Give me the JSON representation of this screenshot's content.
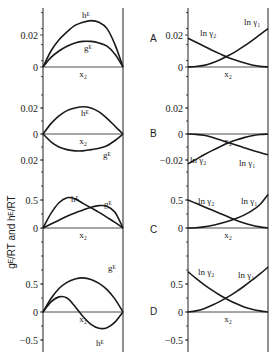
{
  "figure": {
    "ylabel": "gᴱ/RT  and  hᴱ/RT",
    "x_axis_label": "x₂",
    "panel_labels": [
      "A",
      "B",
      "C",
      "D"
    ]
  },
  "chart_data": [
    {
      "panel": "A",
      "side": "left",
      "type": "line",
      "xlabel": "x₂",
      "ylim": [
        -0.006,
        0.04
      ],
      "yticks": [
        {
          "value": 0,
          "label": "0"
        },
        {
          "value": 0.02,
          "label": "0.02"
        }
      ],
      "x": [
        0,
        0.1,
        0.2,
        0.3,
        0.4,
        0.5,
        0.6,
        0.7,
        0.8,
        0.9,
        1.0
      ],
      "series": [
        {
          "name": "hᴱ",
          "values": [
            0,
            0.01,
            0.017,
            0.022,
            0.026,
            0.028,
            0.029,
            0.028,
            0.024,
            0.014,
            0
          ]
        },
        {
          "name": "gᴱ",
          "values": [
            0,
            0.006,
            0.01,
            0.013,
            0.015,
            0.016,
            0.016,
            0.015,
            0.013,
            0.008,
            0
          ]
        }
      ]
    },
    {
      "panel": "A",
      "side": "right",
      "type": "line",
      "xlabel": "x₂",
      "ylim": [
        -0.006,
        0.04
      ],
      "yticks": [
        {
          "value": 0,
          "label": "0"
        },
        {
          "value": 0.02,
          "label": "0.02"
        }
      ],
      "x": [
        0,
        0.1,
        0.2,
        0.3,
        0.4,
        0.5,
        0.6,
        0.7,
        0.8,
        0.9,
        1.0
      ],
      "series": [
        {
          "name": "ln γ₂",
          "values": [
            0.018,
            0.0155,
            0.013,
            0.0105,
            0.0082,
            0.006,
            0.0042,
            0.0026,
            0.0013,
            0.0004,
            0
          ]
        },
        {
          "name": "ln γ₁",
          "values": [
            0,
            0.0003,
            0.001,
            0.0025,
            0.0045,
            0.007,
            0.0098,
            0.013,
            0.0165,
            0.0203,
            0.024
          ]
        }
      ]
    },
    {
      "panel": "B",
      "side": "left",
      "type": "line",
      "xlabel": "x₂",
      "ylim": [
        -0.03,
        0.04
      ],
      "yticks": [
        {
          "value": 0.02,
          "label": "0.02"
        },
        {
          "value": 0,
          "label": "0"
        },
        {
          "value": -0.02,
          "label": "0.02"
        }
      ],
      "x": [
        0,
        0.1,
        0.2,
        0.3,
        0.4,
        0.5,
        0.6,
        0.7,
        0.8,
        0.9,
        1.0
      ],
      "series": [
        {
          "name": "hᴱ",
          "values": [
            0,
            0.008,
            0.014,
            0.018,
            0.02,
            0.021,
            0.02,
            0.017,
            0.012,
            0.006,
            0
          ]
        },
        {
          "name": "gᴱ",
          "values": [
            0,
            -0.006,
            -0.01,
            -0.012,
            -0.013,
            -0.013,
            -0.012,
            -0.011,
            -0.009,
            -0.005,
            0
          ]
        }
      ]
    },
    {
      "panel": "B",
      "side": "right",
      "type": "line",
      "xlabel": "x₂",
      "ylim": [
        -0.03,
        0.04
      ],
      "yticks": [
        {
          "value": 0.02,
          "label": "0.02"
        },
        {
          "value": 0,
          "label": "0"
        },
        {
          "value": -0.02,
          "label": "−0.02"
        }
      ],
      "x": [
        0,
        0.1,
        0.2,
        0.3,
        0.4,
        0.5,
        0.6,
        0.7,
        0.8,
        0.9,
        1.0
      ],
      "series": [
        {
          "name": "ln γ₁",
          "values": [
            0,
            -0.0003,
            -0.001,
            -0.0025,
            -0.0045,
            -0.0065,
            -0.0085,
            -0.0105,
            -0.0125,
            -0.0143,
            -0.016
          ]
        },
        {
          "name": "ln γ₂",
          "values": [
            -0.023,
            -0.0195,
            -0.016,
            -0.0128,
            -0.0098,
            -0.007,
            -0.0047,
            -0.0028,
            -0.0013,
            -0.0004,
            0
          ]
        }
      ]
    },
    {
      "panel": "C",
      "side": "left",
      "type": "line",
      "xlabel": "x₂",
      "ylim": [
        -0.5,
        1.0
      ],
      "yticks": [
        {
          "value": 0,
          "label": "0"
        },
        {
          "value": 0.5,
          "label": "0.5"
        }
      ],
      "x": [
        0,
        0.1,
        0.2,
        0.3,
        0.4,
        0.5,
        0.6,
        0.7,
        0.8,
        0.9,
        1.0
      ],
      "series": [
        {
          "name": "hᴱ",
          "values": [
            0,
            0.26,
            0.45,
            0.54,
            0.52,
            0.44,
            0.36,
            0.28,
            0.19,
            0.1,
            0
          ]
        },
        {
          "name": "gᴱ",
          "values": [
            0,
            0.07,
            0.14,
            0.21,
            0.27,
            0.32,
            0.37,
            0.4,
            0.39,
            0.28,
            0
          ]
        }
      ]
    },
    {
      "panel": "C",
      "side": "right",
      "type": "line",
      "xlabel": "x₂",
      "ylim": [
        -0.5,
        1.0
      ],
      "yticks": [
        {
          "value": 0,
          "label": "0"
        },
        {
          "value": 0.5,
          "label": "0.5"
        }
      ],
      "x": [
        0,
        0.1,
        0.2,
        0.3,
        0.4,
        0.5,
        0.6,
        0.7,
        0.8,
        0.9,
        1.0
      ],
      "series": [
        {
          "name": "ln γ₂",
          "values": [
            0.5,
            0.44,
            0.38,
            0.32,
            0.26,
            0.2,
            0.14,
            0.09,
            0.05,
            0.02,
            0
          ]
        },
        {
          "name": "ln γ₁",
          "values": [
            0,
            0.005,
            0.02,
            0.045,
            0.08,
            0.12,
            0.17,
            0.23,
            0.31,
            0.42,
            0.6
          ]
        }
      ]
    },
    {
      "panel": "D",
      "side": "left",
      "type": "line",
      "xlabel": "x₂",
      "ylim": [
        -0.75,
        1.0
      ],
      "yticks": [
        {
          "value": 0.5,
          "label": "0.5"
        },
        {
          "value": 0,
          "label": "0"
        },
        {
          "value": -0.5,
          "label": "−0.5"
        }
      ],
      "x": [
        0,
        0.1,
        0.2,
        0.3,
        0.4,
        0.5,
        0.6,
        0.7,
        0.8,
        0.9,
        1.0
      ],
      "series": [
        {
          "name": "gᴱ",
          "values": [
            0,
            0.24,
            0.42,
            0.53,
            0.59,
            0.61,
            0.58,
            0.51,
            0.4,
            0.23,
            0
          ]
        },
        {
          "name": "hᴱ",
          "values": [
            0,
            0.18,
            0.27,
            0.25,
            0.1,
            -0.08,
            -0.22,
            -0.29,
            -0.28,
            -0.18,
            0
          ]
        }
      ]
    },
    {
      "panel": "D",
      "side": "right",
      "type": "line",
      "xlabel": "x₂",
      "ylim": [
        -0.75,
        1.0
      ],
      "yticks": [
        {
          "value": 0.5,
          "label": "0.5"
        },
        {
          "value": 0,
          "label": "0"
        },
        {
          "value": -0.5,
          "label": "−0.5"
        }
      ],
      "x": [
        0,
        0.1,
        0.2,
        0.3,
        0.4,
        0.5,
        0.6,
        0.7,
        0.8,
        0.9,
        1.0
      ],
      "series": [
        {
          "name": "ln γ₂",
          "values": [
            0.72,
            0.6,
            0.49,
            0.39,
            0.3,
            0.22,
            0.15,
            0.09,
            0.05,
            0.02,
            0
          ]
        },
        {
          "name": "ln γ₁",
          "values": [
            0,
            0.02,
            0.06,
            0.12,
            0.19,
            0.27,
            0.36,
            0.46,
            0.57,
            0.68,
            0.8
          ]
        }
      ]
    }
  ]
}
